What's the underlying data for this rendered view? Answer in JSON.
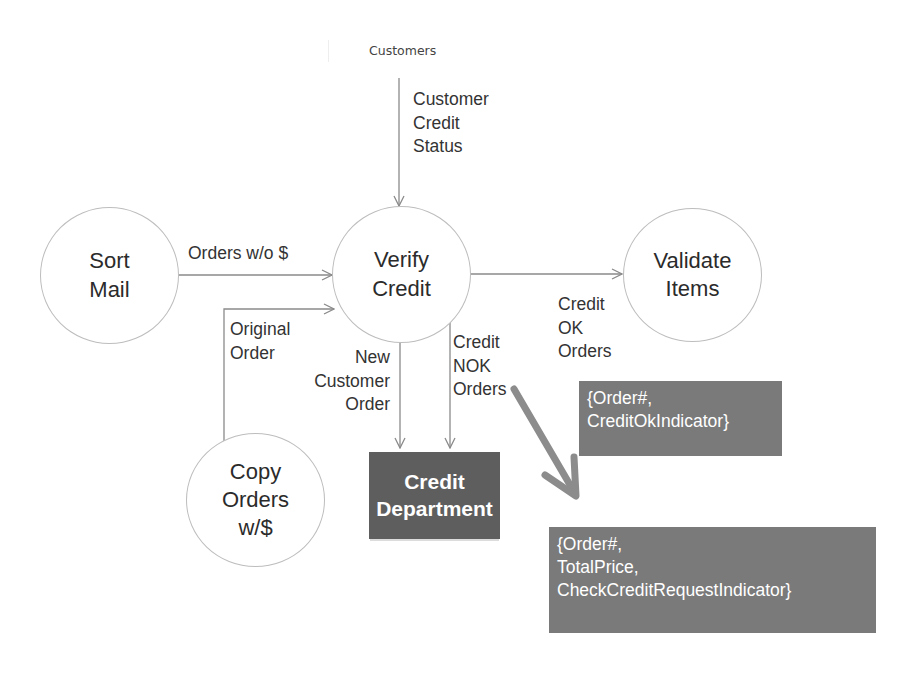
{
  "diagram": {
    "type": "data-flow-diagram",
    "data_store": {
      "label": "Customers"
    },
    "processes": [
      {
        "id": "sort-mail",
        "label": "Sort\nMail"
      },
      {
        "id": "verify-credit",
        "label": "Verify\nCredit"
      },
      {
        "id": "validate-items",
        "label": "Validate\nItems"
      },
      {
        "id": "copy-orders",
        "label": "Copy\nOrders\nw/$"
      }
    ],
    "external_entity": {
      "label": "Credit\nDepartment"
    },
    "flows": {
      "customer_credit_status": "Customer\nCredit\nStatus",
      "orders_without_money": "Orders w/o $",
      "original_order": "Original\nOrder",
      "new_customer_order": "New\nCustomer\nOrder",
      "credit_nok_orders": "Credit\nNOK\nOrders",
      "credit_ok_orders": "Credit\nOK\nOrders"
    },
    "annotations": {
      "credit_ok_structure": "{Order#,\nCreditOkIndicator}",
      "credit_nok_structure": "{Order#,\nTotalPrice,\nCheckCreditRequestIndicator}"
    },
    "colors": {
      "line": "#8a8a8a",
      "entity_fill": "#5e5e5e",
      "note_fill": "#7a7a7a",
      "pointer_arrow": "#8c8c8c",
      "circle_border": "#bdbdbd"
    }
  }
}
